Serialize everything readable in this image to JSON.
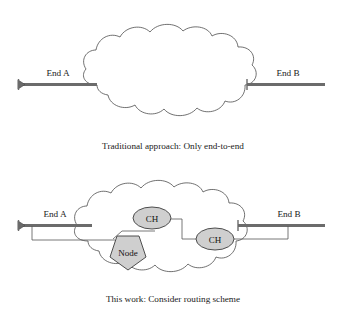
{
  "figure": {
    "title_alt": "Network routing comparison diagram",
    "panels": [
      {
        "id": "traditional",
        "caption": "Traditional approach: Only end-to-end",
        "left_endpoint_label": "End A",
        "right_endpoint_label": "End B",
        "cloud_label": "",
        "inner_nodes": []
      },
      {
        "id": "this-work",
        "caption": "This work: Consider routing scheme",
        "left_endpoint_label": "End A",
        "right_endpoint_label": "End B",
        "cloud_label": "",
        "inner_nodes": [
          {
            "label": "CH",
            "shape": "ellipse"
          },
          {
            "label": "CH",
            "shape": "ellipse"
          },
          {
            "label": "Node",
            "shape": "pentagon"
          }
        ]
      }
    ]
  },
  "icons": {
    "arrow_cap": "left-arrowhead-icon",
    "cloud": "network-cloud-icon"
  },
  "colors": {
    "link_gray": "#6b6b6b",
    "cloud_stroke": "#4c4c4c",
    "node_fill": "#cfcfcf",
    "node_stroke": "#3d3d3d",
    "text": "#1a1a1a",
    "background": "#ffffff"
  }
}
